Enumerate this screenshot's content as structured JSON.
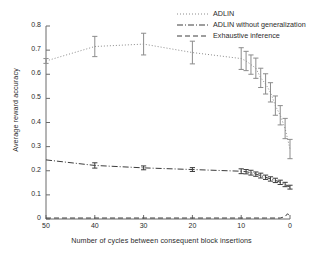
{
  "chart_data": {
    "type": "line",
    "title": "",
    "xlabel": "Number of cycles between consequent block insertions",
    "ylabel": "Average reward accuracy",
    "xlim": [
      50,
      0
    ],
    "ylim": [
      0,
      0.8
    ],
    "xticks": [
      50,
      40,
      30,
      20,
      10,
      0
    ],
    "yticks": [
      0,
      0.1,
      0.2,
      0.3,
      0.4,
      0.5,
      0.6,
      0.7,
      0.8
    ],
    "xtick_labels": [
      "50",
      "40",
      "30",
      "20",
      "10",
      "0"
    ],
    "ytick_labels": [
      "0",
      "0.1",
      "0.2",
      "0.3",
      "0.4",
      "0.5",
      "0.6",
      "0.7",
      "0.8"
    ],
    "x_axis_reversed": true,
    "grid": false,
    "legend_position": "top-right",
    "series": [
      {
        "name": "ADLIN",
        "linestyle": "dotted",
        "color": "#8c8c8c",
        "x": [
          50,
          40,
          30,
          20,
          10,
          9,
          8,
          7,
          6,
          5,
          4,
          3,
          2,
          1,
          0
        ],
        "y": [
          0.655,
          0.715,
          0.725,
          0.69,
          0.665,
          0.655,
          0.64,
          0.625,
          0.585,
          0.56,
          0.525,
          0.47,
          0.43,
          0.375,
          0.29
        ],
        "yerr": [
          0.01,
          0.042,
          0.045,
          0.047,
          0.045,
          0.04,
          0.04,
          0.042,
          0.04,
          0.042,
          0.04,
          0.04,
          0.04,
          0.042,
          0.04
        ]
      },
      {
        "name": "ADLIN without generalization",
        "linestyle": "dashdot",
        "color": "#3c3c3c",
        "x": [
          50,
          40,
          30,
          20,
          10,
          9,
          8,
          7,
          6,
          5,
          4,
          3,
          2,
          1,
          0
        ],
        "y": [
          0.245,
          0.222,
          0.212,
          0.205,
          0.198,
          0.196,
          0.192,
          0.186,
          0.18,
          0.173,
          0.166,
          0.16,
          0.152,
          0.143,
          0.132
        ],
        "yerr": [
          0.0,
          0.011,
          0.008,
          0.008,
          0.01,
          0.009,
          0.01,
          0.009,
          0.01,
          0.009,
          0.009,
          0.009,
          0.009,
          0.009,
          0.008
        ]
      },
      {
        "name": "Exhaustive inference",
        "linestyle": "dashed",
        "color": "#3c3c3c",
        "x": [
          50,
          40,
          30,
          20,
          10,
          5,
          2,
          1,
          0.5,
          0
        ],
        "y": [
          0.004,
          0.004,
          0.004,
          0.004,
          0.004,
          0.004,
          0.004,
          0.01,
          0.022,
          0.01
        ],
        "yerr": [
          0,
          0,
          0,
          0,
          0,
          0,
          0,
          0,
          0,
          0
        ]
      }
    ],
    "legend": [
      {
        "label": "ADLIN",
        "linestyle": "dotted"
      },
      {
        "label": "ADLIN without generalization",
        "linestyle": "dashdot"
      },
      {
        "label": "Exhaustive inference",
        "linestyle": "dashed"
      }
    ]
  },
  "axes": {
    "xlabel": "Number of cycles between consequent block insertions",
    "ylabel": "Average reward accuracy"
  }
}
